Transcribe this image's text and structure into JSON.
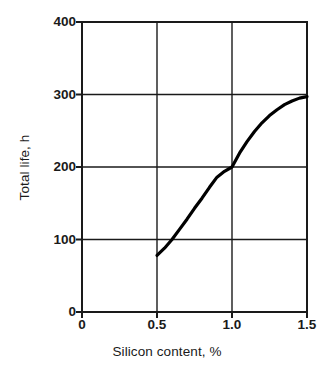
{
  "chart_data": {
    "type": "line",
    "title": "",
    "xlabel": "Silicon content, %",
    "ylabel": "Total life, h",
    "xlim": [
      0,
      1.5
    ],
    "ylim": [
      0,
      400
    ],
    "grid": true,
    "legend": null,
    "xticks": [
      "0",
      "0.5",
      "1.0",
      "1.5"
    ],
    "xtick_values": [
      0,
      0.5,
      1.0,
      1.5
    ],
    "yticks": [
      "0",
      "100",
      "200",
      "300",
      "400"
    ],
    "ytick_values": [
      0,
      100,
      200,
      300,
      400
    ],
    "gridlines_x": [
      0.5,
      1.0
    ],
    "gridlines_y": [
      100,
      200,
      300
    ],
    "series": [
      {
        "name": "Total life",
        "color": "#000000",
        "x": [
          0.5,
          0.55,
          0.6,
          0.65,
          0.7,
          0.75,
          0.8,
          0.85,
          0.9,
          0.95,
          1.0,
          1.05,
          1.1,
          1.15,
          1.2,
          1.25,
          1.3,
          1.35,
          1.4,
          1.45,
          1.5
        ],
        "y": [
          78,
          88,
          100,
          114,
          128,
          143,
          157,
          172,
          186,
          194,
          200,
          219,
          235,
          249,
          261,
          271,
          279,
          286,
          291,
          295,
          297
        ]
      }
    ],
    "annotations": []
  },
  "axes": {
    "y_title": "Total life, h",
    "x_title": "Silicon content, %"
  }
}
